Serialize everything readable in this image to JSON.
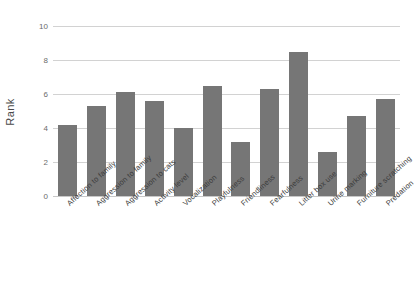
{
  "chart_data": {
    "type": "bar",
    "title": "",
    "xlabel": "",
    "ylabel": "Rank",
    "ylim": [
      0,
      10
    ],
    "ytick_values": [
      0,
      2,
      4,
      6,
      8,
      10
    ],
    "ytick_labels": [
      "0",
      "2",
      "4",
      "6",
      "8",
      "10"
    ],
    "grid": true,
    "legend": "none",
    "bar_color": "#767676",
    "gridline_color": "#d2d2d2",
    "categories": [
      "Affection to family",
      "Aggression to family",
      "Aggression to cats",
      "Activity level",
      "Vocalization",
      "Playfulness",
      "Friendliness",
      "Fearfulness",
      "Litter box use",
      "Urine marking",
      "Furniture scratching",
      "Predation"
    ],
    "values": [
      4.2,
      5.3,
      6.1,
      5.6,
      4.0,
      6.5,
      3.2,
      6.3,
      8.5,
      2.6,
      4.7,
      5.7
    ]
  }
}
